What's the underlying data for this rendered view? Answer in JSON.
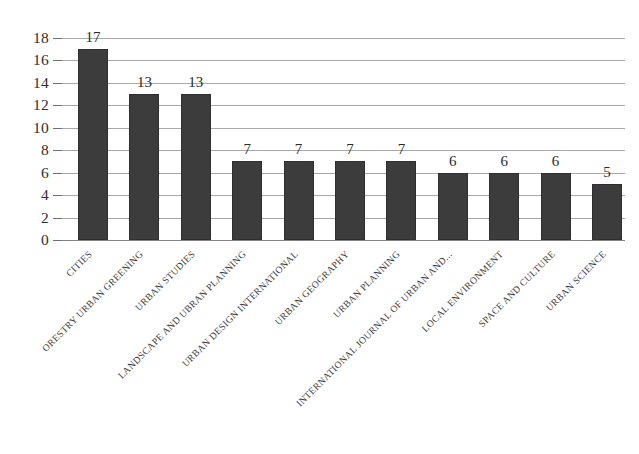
{
  "chart_data": {
    "type": "bar",
    "title": "",
    "subtitle": "",
    "xlabel": "",
    "ylabel": "",
    "ylim": [
      0,
      18
    ],
    "y_ticks": [
      0,
      2,
      4,
      6,
      8,
      10,
      12,
      14,
      16,
      18
    ],
    "grid": true,
    "legend": false,
    "legend_position": "none",
    "bar_color": "#3c3c3c",
    "gridline_color": "#9a9a9a",
    "label_rotation_deg": -45,
    "categories": [
      "CITIES",
      "ORESTRY URBAN GREENING",
      "URBAN STUDIES",
      "LANDSCAPE AND UBRAN PLANNING",
      "URBAN DESIGN INTERNATIONAL",
      "URBAN GEOGRAPHY",
      "URBAN PLANNING",
      "INTERNATIONAL JOURNAL OF URBAN AND...",
      "LOCAL ENVIRONMENT",
      "SPACE AND CULTURE",
      "URBAN SCIENCE"
    ],
    "values": [
      17,
      13,
      13,
      7,
      7,
      7,
      7,
      6,
      6,
      6,
      5
    ],
    "value_labels": [
      "17",
      "13",
      "13",
      "7",
      "7",
      "7",
      "7",
      "6",
      "6",
      "6",
      "5"
    ]
  }
}
